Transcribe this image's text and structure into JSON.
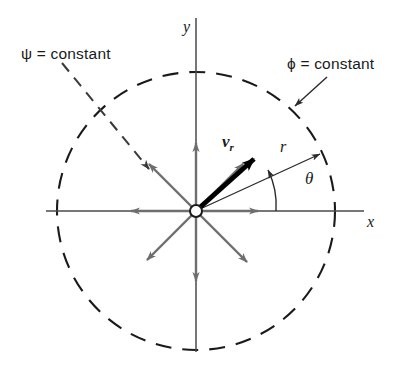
{
  "figure": {
    "background_color": "#ffffff",
    "width": 402,
    "height": 378
  },
  "colors": {
    "ink": "#1a1a1a",
    "gray_arrow": "#6e6e6e",
    "axis": "#4a4a4a",
    "dashed": "#1a1a1a",
    "bold_vector": "#000000"
  },
  "labels": {
    "psi_constant": "ψ = constant",
    "phi_constant": "ϕ = constant",
    "y_axis": "y",
    "x_axis": "x",
    "radius": "r",
    "theta": "θ",
    "velocity_radial": "v",
    "velocity_radial_sub": "r"
  },
  "geometry": {
    "origin": {
      "x": 196,
      "y": 211
    },
    "circle_radius": 139,
    "radial_arrow_length": 64,
    "radial_arrow_angles_deg": [
      0,
      45,
      90,
      135,
      180,
      225,
      270,
      315
    ],
    "r_vector_angle_deg": 25,
    "r_vector_length": 139,
    "vr_vector_angle_deg": 45,
    "vr_vector_length": 84,
    "theta_arc_radius": 78,
    "x_axis_span": {
      "x1": 46,
      "x2": 364
    },
    "y_axis_span": {
      "y1": 18,
      "y2": 352
    }
  },
  "elements": {
    "origin_marker": "open-circle",
    "circle_style": "dashed",
    "phi_leader": {
      "from": {
        "x": 326,
        "y": 78
      },
      "to": {
        "x": 294,
        "y": 107
      },
      "style": "solid-arrow"
    },
    "psi_leader": {
      "from": {
        "x": 63,
        "y": 64
      },
      "to": {
        "x": 147,
        "y": 167
      },
      "style": "dashed-arrow"
    }
  }
}
